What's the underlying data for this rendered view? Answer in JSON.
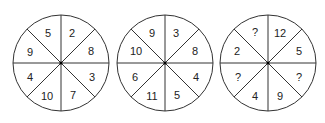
{
  "puzzle": {
    "stroke_color": "#333333",
    "wheels": [
      {
        "id": "wheel-1",
        "sectors": [
          {
            "position": "top-right",
            "value": "2"
          },
          {
            "position": "right-upper",
            "value": "8"
          },
          {
            "position": "right-lower",
            "value": "3"
          },
          {
            "position": "bottom-right",
            "value": "7"
          },
          {
            "position": "bottom-left",
            "value": "10"
          },
          {
            "position": "left-lower",
            "value": "4"
          },
          {
            "position": "left-upper",
            "value": "9"
          },
          {
            "position": "top-left",
            "value": "5"
          }
        ]
      },
      {
        "id": "wheel-2",
        "sectors": [
          {
            "position": "top-right",
            "value": "3"
          },
          {
            "position": "right-upper",
            "value": "8"
          },
          {
            "position": "right-lower",
            "value": "4"
          },
          {
            "position": "bottom-right",
            "value": "5"
          },
          {
            "position": "bottom-left",
            "value": "11"
          },
          {
            "position": "left-lower",
            "value": "6"
          },
          {
            "position": "left-upper",
            "value": "10"
          },
          {
            "position": "top-left",
            "value": "9"
          }
        ]
      },
      {
        "id": "wheel-3",
        "sectors": [
          {
            "position": "top-right",
            "value": "12"
          },
          {
            "position": "right-upper",
            "value": "5"
          },
          {
            "position": "right-lower",
            "value": "?"
          },
          {
            "position": "bottom-right",
            "value": "9"
          },
          {
            "position": "bottom-left",
            "value": "4"
          },
          {
            "position": "left-lower",
            "value": "?"
          },
          {
            "position": "left-upper",
            "value": "2"
          },
          {
            "position": "top-left",
            "value": "?"
          }
        ]
      }
    ]
  }
}
